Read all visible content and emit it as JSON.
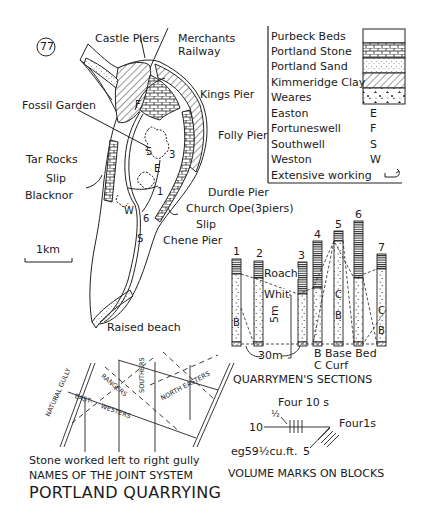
{
  "figure_number": "77",
  "title": "PORTLAND QUARRYING",
  "map": {
    "labels": {
      "castle_piers": "Castle Piers",
      "merchants_railway_1": "Merchants",
      "merchants_railway_2": "Railway",
      "kings_pier": "Kings Pier",
      "fossil_garden": "Fossil Garden",
      "folly_pier": "Folly Pier",
      "tar_rocks": "Tar Rocks",
      "slip_west": "Slip",
      "blacknor": "Blacknor",
      "durdle_pier": "Durdle Pier",
      "church_ope": "Church Ope(3piers)",
      "slip_east": "Slip",
      "chene_pier": "Chene Pier",
      "raised_beach": "Raised beach",
      "scale": "1km"
    },
    "section_numbers": [
      "F",
      "5",
      "3",
      "E",
      "1",
      "W",
      "6",
      "S"
    ]
  },
  "legend": {
    "items": [
      {
        "label": "Purbeck Beds",
        "symbol": "blank-box"
      },
      {
        "label": "Portland Stone",
        "symbol": "brick-pattern"
      },
      {
        "label": "Portland Sand",
        "symbol": "dot-pattern"
      },
      {
        "label": "Kimmeridge Clay",
        "symbol": "hatch-pattern"
      },
      {
        "label": "Weares",
        "symbol": "rubble-pattern"
      },
      {
        "label": "Easton",
        "symbol": "E"
      },
      {
        "label": "Fortuneswell",
        "symbol": "F"
      },
      {
        "label": "Southwell",
        "symbol": "S"
      },
      {
        "label": "Weston",
        "symbol": "W"
      },
      {
        "label": "Extensive working",
        "symbol": "working-icon"
      }
    ]
  },
  "sections": {
    "title": "QUARRYMEN'S SECTIONS",
    "columns": [
      "1",
      "2",
      "3",
      "4",
      "5",
      "6",
      "7"
    ],
    "bed_labels": {
      "roach": "Roach",
      "whit": "Whit",
      "b": "B",
      "c": "C"
    },
    "vertical_scale": "5m",
    "horizontal_scale": "30m",
    "key": {
      "b": "B Base Bed",
      "c": "C Curf"
    }
  },
  "volume_marks": {
    "title": "VOLUME MARKS ON BLOCKS",
    "four_tens": "Four 10 s",
    "half": "½",
    "ten": "10",
    "four_ones": "Four1s",
    "five": "5",
    "example": "eg59½cu.ft."
  },
  "joint_system": {
    "title": "NAMES OF THE JOINT SYSTEM",
    "note": "Stone worked left to right gully",
    "labels": {
      "natural_gully": "NATURAL GULLY",
      "rangers": "RANGERS",
      "southers": "SOUTHERS",
      "north_easters": "NORTH EASTERS",
      "east": "EAST-",
      "westers": "WESTERS"
    }
  }
}
